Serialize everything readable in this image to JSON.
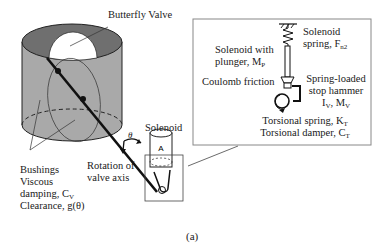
{
  "figure": {
    "caption": "(a)",
    "labels": {
      "butterfly_valve": "Butterfly Valve",
      "solenoid": "Solenoid",
      "theta": "θ",
      "rotation_line1": "Rotation of",
      "rotation_line2": "valve axis",
      "bushings": "Bushings",
      "viscous": "Viscous",
      "damping": "damping, C",
      "damping_sub": "V",
      "clearance": "Clearance, g(θ)"
    },
    "inset": {
      "solenoid_spring_line1": "Solenoid",
      "solenoid_spring_line2": "spring, F",
      "solenoid_spring_sub": "n2",
      "plunger_line1": "Solenoid with",
      "plunger_line2": "plunger, M",
      "plunger_sub": "P",
      "coulomb": "Coulomb friction",
      "hammer_line1": "Spring-loaded",
      "hammer_line2": "stop hammer",
      "hammer_line3a": "I",
      "hammer_sub1": "V",
      "hammer_line3b": ", M",
      "hammer_sub2": "V",
      "torsional_spring": "Torsional spring, K",
      "torsional_spring_sub": "T",
      "torsional_damper": "Torsional damper, C",
      "torsional_damper_sub": "T"
    },
    "colors": {
      "cylinder_body": "#a8a8a8",
      "cylinder_top": "#6e6e6e",
      "line": "#111111",
      "inset_border": "#888888"
    }
  }
}
